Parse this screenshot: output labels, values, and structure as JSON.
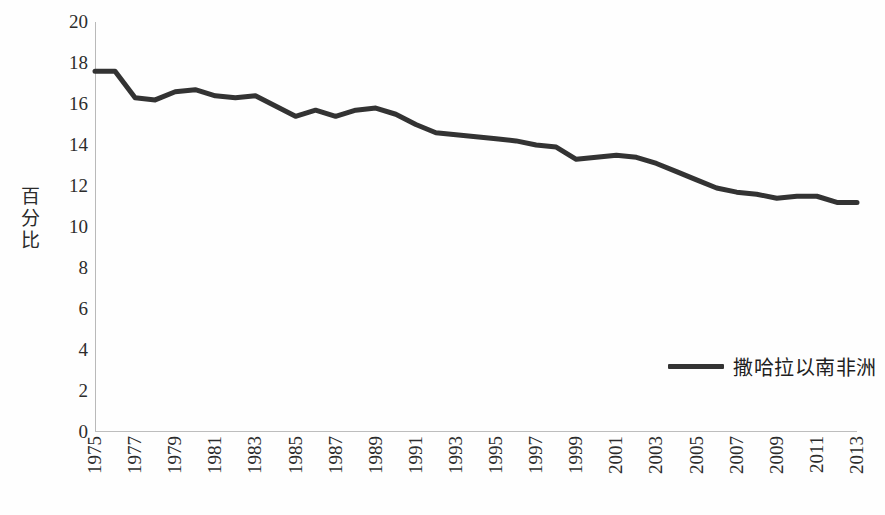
{
  "chart_data": {
    "type": "line",
    "title": "",
    "xlabel": "",
    "ylabel": "百分比",
    "ylim": [
      0,
      20
    ],
    "ytick_step": 2,
    "yticks": [
      "20",
      "18",
      "16",
      "14",
      "12",
      "10",
      "8",
      "6",
      "4",
      "2",
      "0"
    ],
    "xlim": [
      1975,
      2013
    ],
    "xticks": [
      "1975",
      "1977",
      "1979",
      "1981",
      "1983",
      "1985",
      "1987",
      "1989",
      "1991",
      "1993",
      "1995",
      "1997",
      "1999",
      "2001",
      "2003",
      "2005",
      "2007",
      "2009",
      "2011",
      "2013"
    ],
    "grid": false,
    "legend_position": "inside-right",
    "series": [
      {
        "name": "撒哈拉以南非洲",
        "color": "#333333",
        "x": [
          1975,
          1976,
          1977,
          1978,
          1979,
          1980,
          1981,
          1982,
          1983,
          1984,
          1985,
          1986,
          1987,
          1988,
          1989,
          1990,
          1991,
          1992,
          1993,
          1994,
          1995,
          1996,
          1997,
          1998,
          1999,
          2000,
          2001,
          2002,
          2003,
          2004,
          2005,
          2006,
          2007,
          2008,
          2009,
          2010,
          2011,
          2012,
          2013
        ],
        "values": [
          17.6,
          17.6,
          16.3,
          16.2,
          16.6,
          16.7,
          16.4,
          16.3,
          16.4,
          15.9,
          15.4,
          15.7,
          15.4,
          15.7,
          15.8,
          15.5,
          15.0,
          14.6,
          14.5,
          14.4,
          14.3,
          14.2,
          14.0,
          13.9,
          13.3,
          13.4,
          13.5,
          13.4,
          13.1,
          12.7,
          12.3,
          11.9,
          11.7,
          11.6,
          11.4,
          11.5,
          11.5,
          11.2,
          11.2
        ]
      }
    ]
  },
  "legend": {
    "label": "撒哈拉以南非洲"
  },
  "axes": {
    "y_title": "百分比"
  }
}
